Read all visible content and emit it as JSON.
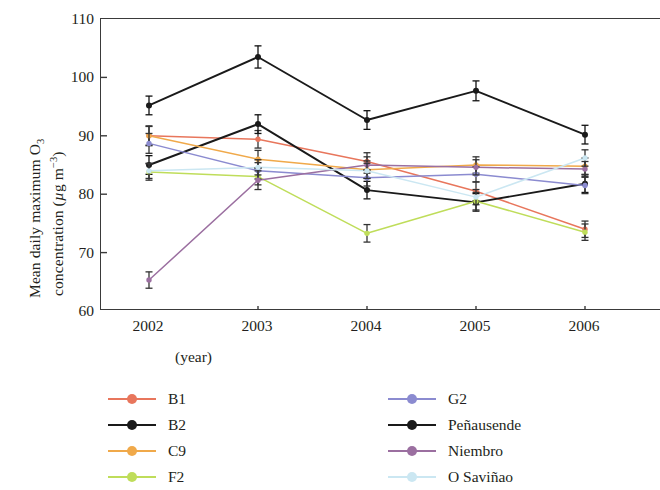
{
  "chart_data": {
    "type": "line",
    "title": "",
    "xlabel": "(year)",
    "ylabel_line1": "Mean daily maximum O₃",
    "ylabel_line2": "concentration (μg m⁻³)",
    "categories": [
      "2002",
      "2003",
      "2004",
      "2005",
      "2006"
    ],
    "x": [
      2002,
      2003,
      2004,
      2005,
      2006
    ],
    "ylim": [
      60,
      110
    ],
    "yticks": [
      60,
      70,
      80,
      90,
      100,
      110
    ],
    "xlim": [
      2001.6,
      2006.4
    ],
    "grid": false,
    "legend_position": "below-plot-two-columns",
    "error_bars": "symmetric standard error",
    "series": [
      {
        "name": "B1",
        "color": "#e8765c",
        "values": [
          90.0,
          89.4,
          85.6,
          80.5,
          74.0
        ],
        "errors": [
          1.6,
          1.5,
          1.5,
          1.6,
          1.4
        ]
      },
      {
        "name": "B2",
        "color": "#1a1a1a",
        "values": [
          85.0,
          92.0,
          80.7,
          78.6,
          81.8
        ],
        "errors": [
          1.6,
          1.6,
          1.5,
          1.5,
          1.5
        ]
      },
      {
        "name": "C9",
        "color": "#f0a94a",
        "values": [
          90.0,
          86.0,
          84.2,
          85.0,
          84.8
        ],
        "errors": [
          1.7,
          1.5,
          1.5,
          1.4,
          1.4
        ]
      },
      {
        "name": "F2",
        "color": "#bfdd5a",
        "values": [
          83.8,
          83.0,
          73.3,
          78.8,
          73.5
        ],
        "errors": [
          1.4,
          1.4,
          1.5,
          1.5,
          1.4
        ]
      },
      {
        "name": "G2",
        "color": "#8b8bd0",
        "values": [
          88.7,
          84.0,
          82.8,
          83.4,
          81.5
        ],
        "errors": [
          1.7,
          1.4,
          1.4,
          1.3,
          1.4
        ]
      },
      {
        "name": "Peñausende",
        "color": "#1a1a1a",
        "values": [
          95.2,
          103.5,
          92.7,
          97.7,
          90.2
        ],
        "errors": [
          1.6,
          1.9,
          1.6,
          1.7,
          1.6
        ]
      },
      {
        "name": "Niembro",
        "color": "#9b6fa0",
        "values": [
          65.3,
          82.4,
          85.0,
          84.6,
          84.3
        ],
        "errors": [
          1.4,
          1.6,
          1.4,
          1.3,
          1.3
        ]
      },
      {
        "name": "O Saviñao",
        "color": "#cbe7f2",
        "values": [
          84.0,
          84.6,
          84.0,
          79.5,
          86.2
        ],
        "errors": [
          1.3,
          1.3,
          1.3,
          1.3,
          1.4
        ]
      }
    ]
  },
  "legend": {
    "left_column": [
      {
        "label": "B1",
        "color": "#e8765c"
      },
      {
        "label": "B2",
        "color": "#1a1a1a"
      },
      {
        "label": "C9",
        "color": "#f0a94a"
      },
      {
        "label": "F2",
        "color": "#bfdd5a"
      }
    ],
    "right_column": [
      {
        "label": "G2",
        "color": "#8b8bd0"
      },
      {
        "label": "Peñausende",
        "color": "#1a1a1a"
      },
      {
        "label": "Niembro",
        "color": "#9b6fa0"
      },
      {
        "label": "O Saviñao",
        "color": "#cbe7f2"
      }
    ]
  },
  "axis": {
    "y_tick_labels": [
      "110",
      "100",
      "90",
      "80",
      "70",
      "60"
    ],
    "x_tick_labels": [
      "2002",
      "2003",
      "2004",
      "2005",
      "2006"
    ],
    "x_title": "(year)"
  }
}
